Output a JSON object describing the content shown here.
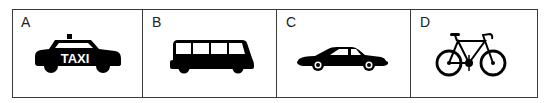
{
  "panels": [
    {
      "letter": "A",
      "vehicle": "taxi",
      "sign_text": "TAXI"
    },
    {
      "letter": "B",
      "vehicle": "bus"
    },
    {
      "letter": "C",
      "vehicle": "car"
    },
    {
      "letter": "D",
      "vehicle": "bicycle"
    }
  ],
  "colors": {
    "ink": "#000000",
    "border": "#3a3a3a",
    "background": "#ffffff"
  }
}
